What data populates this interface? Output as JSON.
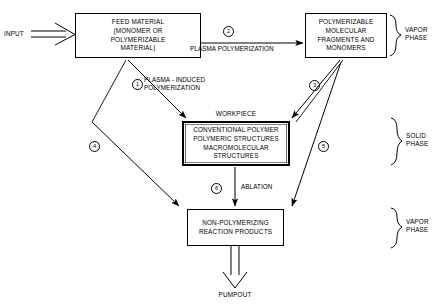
{
  "diagram": {
    "nodes": {
      "input": {
        "label": "INPUT"
      },
      "feed_material": {
        "lines": [
          "FEED MATERIAL",
          "(MONOMER OR",
          "POLYMERIZABLE",
          "MATERIAL)"
        ]
      },
      "polymerizable_fragments": {
        "lines": [
          "POLYMERIZABLE",
          "MOLECULAR",
          "FRAGMENTS AND",
          "MONOMERS"
        ]
      },
      "workpiece_caption": {
        "label": "WORKPIECE"
      },
      "workpiece": {
        "lines": [
          "CONVENTIONAL POLYMER",
          "POLYMERIC STRUCTURES",
          "MACROMOLECULAR",
          "STRUCTURES"
        ]
      },
      "non_polymerizing": {
        "lines": [
          "NON-POLYMERIZING",
          "REACTION PRODUCTS"
        ]
      },
      "pumpout": {
        "label": "PUMPOUT"
      }
    },
    "edges": [
      {
        "number": "1",
        "label_lines": [
          "PLASMA - INDUCED",
          "POLYMERIZATION"
        ]
      },
      {
        "number": "2",
        "label_lines": [
          "PLASMA POLYMERIZATION"
        ]
      },
      {
        "number": "3",
        "label_lines": []
      },
      {
        "number": "4",
        "label_lines": []
      },
      {
        "number": "5",
        "label_lines": []
      },
      {
        "number": "6",
        "label_lines": [
          "ABLATION"
        ]
      }
    ],
    "phases": [
      {
        "id": "vapor-top",
        "lines": [
          "VAPOR",
          "PHASE"
        ]
      },
      {
        "id": "solid",
        "lines": [
          "SOLID",
          "PHASE"
        ]
      },
      {
        "id": "vapor-bottom",
        "lines": [
          "VAPOR",
          "PHASE"
        ]
      }
    ],
    "colors": {
      "stroke": "#000000",
      "background": "#ffffff"
    }
  }
}
